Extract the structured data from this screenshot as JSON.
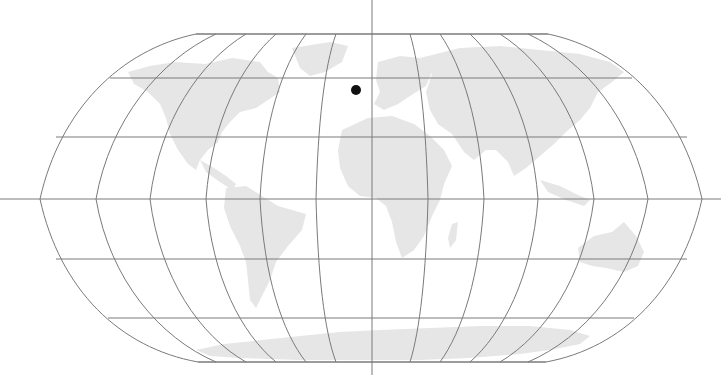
{
  "map": {
    "projection": "Robinson",
    "graticule_color": "#7a7a7a",
    "land_color": "#e6e6e6",
    "background_color": "#ffffff",
    "center": {
      "x": 372,
      "y": 199
    },
    "axes": {
      "horizontal_y": 199,
      "vertical_x": 372
    },
    "marker": {
      "icon": "location-dot-icon",
      "x": 356,
      "y": 90,
      "radius": 5,
      "color": "#111111"
    },
    "continents": [
      "North America",
      "South America",
      "Europe",
      "Africa",
      "Asia",
      "Australia",
      "Antarctica",
      "Greenland"
    ]
  }
}
